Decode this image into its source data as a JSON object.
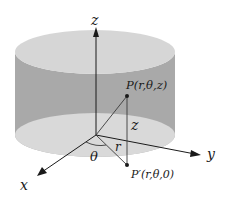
{
  "diagram": {
    "axes": {
      "z_label": "z",
      "y_label": "y",
      "x_label": "x"
    },
    "points": {
      "P_label": "P(r,θ,z)",
      "P_prime_label": "P′(r,θ,0)"
    },
    "segments": {
      "height_label": "z",
      "radius_label": "r",
      "angle_label": "θ"
    },
    "colors": {
      "cylinder_side": "#a9a9a9",
      "cylinder_top": "#d6d6d6",
      "cylinder_bottom": "#d9d9d9",
      "axes": "#1a1a1a",
      "lines": "#3a3a3a"
    }
  }
}
